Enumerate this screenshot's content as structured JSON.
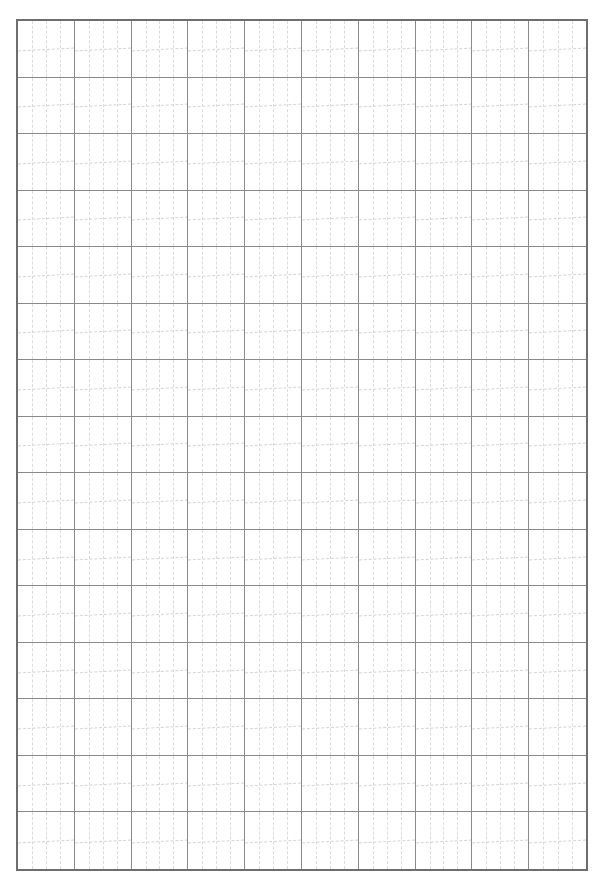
{
  "page": {
    "type": "practice-grid-paper",
    "columns": 10,
    "rows": 15,
    "colors": {
      "border": "#6e6e6e",
      "cell_line": "#8a8a8a",
      "guide_line": "#dcdcdc",
      "background": "#ffffff"
    }
  }
}
